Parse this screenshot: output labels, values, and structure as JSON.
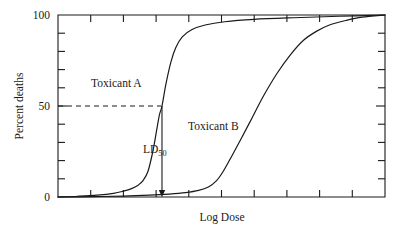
{
  "chart_data": {
    "type": "line",
    "title": "",
    "xlabel": "Log Dose",
    "ylabel": "Percent deaths",
    "ylim": [
      0,
      100
    ],
    "xlim": [
      0,
      10
    ],
    "grid": false,
    "legend_position": "inline-annotations",
    "y_tick_labels": [
      "100",
      "50",
      "0"
    ],
    "y_tick_values": [
      100,
      50,
      0
    ],
    "y_minor_ticks": [
      10,
      20,
      30,
      40,
      60,
      70,
      80,
      90
    ],
    "x_tick_count": 9,
    "annotations": [
      {
        "text": "Toxicant A",
        "x": 2.2,
        "y": 66
      },
      {
        "text": "Toxicant B",
        "x": 5.1,
        "y": 38
      },
      {
        "text": "LD",
        "subscript": "50",
        "x": 3.2,
        "y": 25
      }
    ],
    "reference_lines": [
      {
        "type": "horizontal-dashed",
        "y": 50,
        "label": "LD50 reference",
        "from_x": 0,
        "to_x": 3.15
      },
      {
        "type": "vertical-arrow",
        "x": 3.18,
        "from_y": 50,
        "to_y": 0,
        "label": "LD50 dose marker"
      }
    ],
    "series": [
      {
        "name": "Toxicant A",
        "x": [
          0.0,
          0.6,
          1.2,
          1.7,
          2.0,
          2.25,
          2.45,
          2.6,
          2.75,
          2.9,
          3.0,
          3.1,
          3.18,
          3.3,
          3.45,
          3.6,
          3.8,
          4.1,
          4.5,
          5.1,
          6.0,
          7.2,
          8.6,
          10.0
        ],
        "y": [
          0.0,
          0.4,
          1.0,
          2.0,
          3.2,
          4.6,
          6.5,
          9.0,
          14.0,
          25.0,
          35.0,
          45.0,
          50.0,
          62.0,
          74.0,
          82.0,
          88.0,
          92.0,
          94.5,
          96.3,
          97.6,
          98.5,
          99.3,
          100.0
        ]
      },
      {
        "name": "Toxicant B",
        "x": [
          0.0,
          1.0,
          2.0,
          2.8,
          3.4,
          3.9,
          4.3,
          4.6,
          4.85,
          5.05,
          5.3,
          5.6,
          5.95,
          6.3,
          6.7,
          7.1,
          7.5,
          7.9,
          8.3,
          8.8,
          9.3,
          10.0
        ],
        "y": [
          0.0,
          0.2,
          0.5,
          1.0,
          1.6,
          2.4,
          3.6,
          5.5,
          9.0,
          14.0,
          22.0,
          32.0,
          44.0,
          56.0,
          68.0,
          78.0,
          86.0,
          91.0,
          94.5,
          97.0,
          98.8,
          100.0
        ]
      }
    ]
  },
  "axis": {
    "y_label": "Percent deaths",
    "x_label": "Log Dose",
    "y_top": "100",
    "y_mid": "50",
    "y_bottom": "0"
  },
  "labels": {
    "toxicant_a": "Toxicant A",
    "toxicant_b": "Toxicant B",
    "ld_base": "LD",
    "ld_subscript": "50"
  }
}
